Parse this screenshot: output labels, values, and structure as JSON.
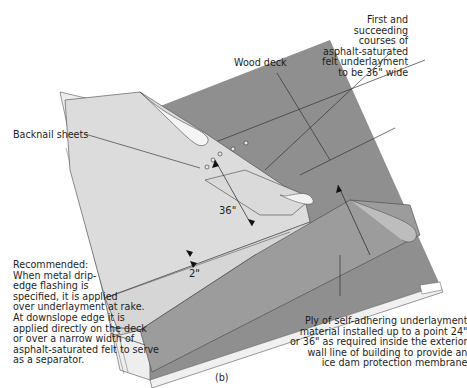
{
  "diagram": {
    "caption": "(b)",
    "labels": {
      "first_courses": [
        "First and",
        "succeeding",
        "courses of",
        "asphalt-saturated",
        "felt underlayment",
        "to be 36\" wide"
      ],
      "wood_deck": "Wood deck",
      "backnail": "Backnail sheets",
      "recommended": [
        "Recommended:",
        "When metal drip-",
        "edge flashing is",
        "specified, it is applied",
        "over underlayment at rake.",
        "At downslope edge it is",
        "applied directly on the deck",
        "or over a narrow width of",
        "asphalt-saturated felt to serve",
        "as a separator."
      ],
      "ply": [
        "Ply of self-adhering underlayment",
        "material installed up to a point 24\"",
        "or 36\" as required inside the exterior",
        "wall line of building to provide an",
        "ice dam protection membrane"
      ]
    },
    "dimensions": {
      "course_width": "36\"",
      "overlap": "2\""
    },
    "colors": {
      "deck": "#8f8f8f",
      "felt": "#dcdcdc",
      "membrane": "#9a9a9a",
      "edge": "#f0f0f0",
      "line": "#2a2a2a"
    }
  }
}
